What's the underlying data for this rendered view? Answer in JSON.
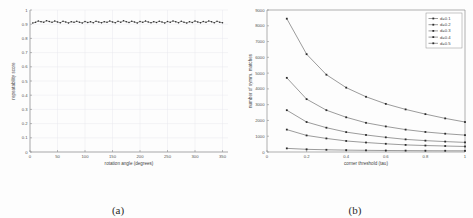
{
  "figure": {
    "panel_a_caption": "(a)",
    "panel_b_caption": "(b)"
  },
  "chart_data": [
    {
      "type": "line",
      "panel": "a",
      "title": "",
      "xlabel": "rotation angle (degrees)",
      "ylabel": "repeatability score",
      "xlim": [
        0,
        360
      ],
      "ylim": [
        0,
        1
      ],
      "xticks": [
        0,
        50,
        100,
        150,
        200,
        250,
        300,
        350
      ],
      "yticks": [
        0,
        0.1,
        0.2,
        0.3,
        0.4,
        0.5,
        0.6,
        0.7,
        0.8,
        0.9,
        1
      ],
      "xticklabels": [
        "0",
        "50",
        "100",
        "150",
        "200",
        "250",
        "300",
        "350"
      ],
      "yticklabels": [
        "0",
        "0.1",
        "0.2",
        "0.3",
        "0.4",
        "0.5",
        "0.6",
        "0.7",
        "0.8",
        "0.9",
        "1"
      ],
      "grid": true,
      "legend": null,
      "marker": "dot",
      "series": [
        {
          "name": "repeatability",
          "x": [
            5,
            10,
            15,
            20,
            25,
            30,
            35,
            40,
            45,
            50,
            55,
            60,
            65,
            70,
            75,
            80,
            85,
            90,
            95,
            100,
            105,
            110,
            115,
            120,
            125,
            130,
            135,
            140,
            145,
            150,
            155,
            160,
            165,
            170,
            175,
            180,
            185,
            190,
            195,
            200,
            205,
            210,
            215,
            220,
            225,
            230,
            235,
            240,
            245,
            250,
            255,
            260,
            265,
            270,
            275,
            280,
            285,
            290,
            295,
            300,
            305,
            310,
            315,
            320,
            325,
            330,
            335,
            340,
            345,
            350
          ],
          "values": [
            0.909,
            0.913,
            0.922,
            0.918,
            0.914,
            0.925,
            0.919,
            0.913,
            0.922,
            0.916,
            0.91,
            0.921,
            0.915,
            0.909,
            0.918,
            0.913,
            0.92,
            0.914,
            0.909,
            0.919,
            0.912,
            0.917,
            0.911,
            0.921,
            0.915,
            0.91,
            0.918,
            0.913,
            0.922,
            0.916,
            0.911,
            0.92,
            0.914,
            0.924,
            0.918,
            0.912,
            0.921,
            0.915,
            0.909,
            0.919,
            0.913,
            0.922,
            0.916,
            0.91,
            0.918,
            0.912,
            0.921,
            0.915,
            0.909,
            0.919,
            0.913,
            0.923,
            0.917,
            0.911,
            0.92,
            0.914,
            0.908,
            0.918,
            0.912,
            0.922,
            0.916,
            0.91,
            0.919,
            0.913,
            0.923,
            0.917,
            0.911,
            0.92,
            0.914,
            0.91
          ]
        }
      ]
    },
    {
      "type": "line",
      "panel": "b",
      "title": "",
      "xlabel": "corner threshold (tau)",
      "ylabel": "number of symm. matches",
      "xlim": [
        0,
        1
      ],
      "ylim": [
        0,
        9000
      ],
      "xticks": [
        0,
        0.2,
        0.4,
        0.6,
        0.8,
        1
      ],
      "yticks": [
        0,
        1000,
        2000,
        3000,
        4000,
        5000,
        6000,
        7000,
        8000,
        9000
      ],
      "xticklabels": [
        "0",
        "0.2",
        "0.4",
        "0.6",
        "0.8",
        "1"
      ],
      "yticklabels": [
        "0",
        "1000",
        "2000",
        "3000",
        "4000",
        "5000",
        "6000",
        "7000",
        "8000",
        "9000"
      ],
      "grid": false,
      "legend": {
        "position": "top-right",
        "entries": [
          "d=0.1",
          "d=0.2",
          "d=0.3",
          "d=0.4",
          "d=0.5"
        ]
      },
      "x": [
        0.1,
        0.2,
        0.3,
        0.4,
        0.5,
        0.6,
        0.7,
        0.8,
        0.9,
        1.0
      ],
      "series": [
        {
          "name": "d=0.1",
          "values": [
            8450,
            6200,
            4900,
            4080,
            3500,
            3050,
            2700,
            2400,
            2130,
            1900
          ]
        },
        {
          "name": "d=0.2",
          "values": [
            4700,
            3350,
            2650,
            2200,
            1850,
            1620,
            1420,
            1270,
            1160,
            1070
          ]
        },
        {
          "name": "d=0.3",
          "values": [
            2650,
            1900,
            1540,
            1260,
            1080,
            930,
            800,
            720,
            660,
            610
          ]
        },
        {
          "name": "d=0.4",
          "values": [
            1420,
            1050,
            860,
            700,
            600,
            520,
            450,
            410,
            380,
            350
          ]
        },
        {
          "name": "d=0.5",
          "values": [
            230,
            170,
            140,
            120,
            105,
            95,
            88,
            82,
            78,
            75
          ]
        }
      ]
    }
  ]
}
